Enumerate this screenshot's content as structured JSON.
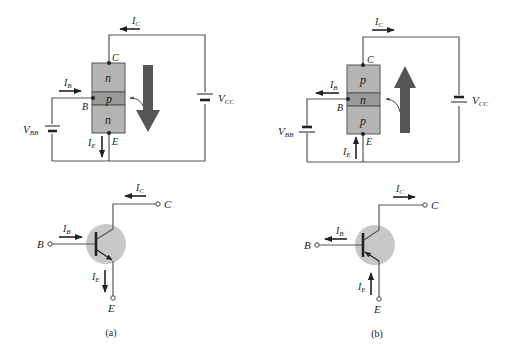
{
  "figure": {
    "panel_a": {
      "caption": "(a)",
      "structure": {
        "type": "npn",
        "top_layer": "n",
        "middle_layer": "p",
        "bottom_layer": "n"
      },
      "labels": {
        "collector": "C",
        "base": "B",
        "emitter": "E",
        "ic": "I",
        "ic_sub": "C",
        "ib": "I",
        "ib_sub": "B",
        "ie": "I",
        "ie_sub": "E",
        "vbb": "V",
        "vbb_sub": "BB",
        "vcc": "V",
        "vcc_sub": "CC"
      },
      "flow_arrow_direction": "down"
    },
    "panel_b": {
      "caption": "(b)",
      "structure": {
        "type": "pnp",
        "top_layer": "p",
        "middle_layer": "n",
        "bottom_layer": "p"
      },
      "labels": {
        "collector": "C",
        "base": "B",
        "emitter": "E",
        "ic": "I",
        "ic_sub": "C",
        "ib": "I",
        "ib_sub": "B",
        "ie": "I",
        "ie_sub": "E",
        "vbb": "V",
        "vbb_sub": "BB",
        "vcc": "V",
        "vcc_sub": "CC"
      },
      "flow_arrow_direction": "up"
    },
    "colors": {
      "layer_fill": "#b4b4b4",
      "base_layer_fill": "#9a9a9a",
      "flow_arrow": "#555555",
      "symbol_circle": "#c8c8c8",
      "wire": "#555555"
    }
  }
}
